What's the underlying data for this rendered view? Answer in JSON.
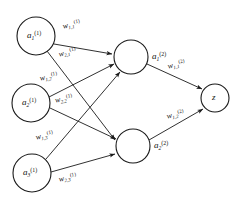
{
  "figure": {
    "type": "neural-network-diagram",
    "background_color": "#ffffff",
    "stroke_color": "#1a1a1a",
    "width": 240,
    "height": 206
  },
  "layers": [
    {
      "name": "input-layer",
      "nodes": [
        {
          "id": "a1-1",
          "base": "a",
          "sub": "1",
          "sup": "(1)",
          "cx": 36,
          "cy": 36,
          "r": 19,
          "label_side": "inside"
        },
        {
          "id": "a2-1",
          "base": "a",
          "sub": "2",
          "sup": "(1)",
          "cx": 31,
          "cy": 103,
          "r": 19,
          "label_side": "inside"
        },
        {
          "id": "a3-1",
          "base": "a",
          "sub": "3",
          "sup": "(1)",
          "cx": 32,
          "cy": 173,
          "r": 19,
          "label_side": "inside"
        }
      ]
    },
    {
      "name": "hidden-layer",
      "nodes": [
        {
          "id": "a1-2",
          "base": "a",
          "sub": "1",
          "sup": "(2)",
          "cx": 131,
          "cy": 57,
          "r": 17,
          "label_side": "right"
        },
        {
          "id": "a2-2",
          "base": "a",
          "sub": "2",
          "sup": "(2)",
          "cx": 133,
          "cy": 146,
          "r": 17,
          "label_side": "right"
        }
      ]
    },
    {
      "name": "output-layer",
      "nodes": [
        {
          "id": "z",
          "base": "z",
          "sub": "",
          "sup": "",
          "cx": 215,
          "cy": 98,
          "r": 14,
          "label_side": "inside"
        }
      ]
    }
  ],
  "edges": [
    {
      "id": "e-a1-h1",
      "from": "a1-1",
      "to": "a1-2"
    },
    {
      "id": "e-a1-h2",
      "from": "a1-1",
      "to": "a2-2"
    },
    {
      "id": "e-a2-h1",
      "from": "a2-1",
      "to": "a1-2"
    },
    {
      "id": "e-a2-h2",
      "from": "a2-1",
      "to": "a2-2"
    },
    {
      "id": "e-a3-h1",
      "from": "a3-1",
      "to": "a1-2"
    },
    {
      "id": "e-a3-h2",
      "from": "a3-1",
      "to": "a2-2"
    },
    {
      "id": "e-h1-z",
      "from": "a1-2",
      "to": "z"
    },
    {
      "id": "e-h2-z",
      "from": "a2-2",
      "to": "z"
    }
  ],
  "node_labels": {
    "a1_1": {
      "base": "a",
      "sub": "1",
      "sup": "(1)"
    },
    "a2_1": {
      "base": "a",
      "sub": "2",
      "sup": "(1)"
    },
    "a3_1": {
      "base": "a",
      "sub": "3",
      "sup": "(1)"
    },
    "a1_2": {
      "base": "a",
      "sub": "1",
      "sup": "(2)"
    },
    "a2_2": {
      "base": "a",
      "sub": "2",
      "sup": "(2)"
    },
    "z": {
      "base": "z",
      "sub": "",
      "sup": ""
    }
  },
  "weight_labels": {
    "w11_1": {
      "base": "w",
      "sub": "1,1",
      "sup": "(1)",
      "edge": "e-a1-h1"
    },
    "w21_1": {
      "base": "w",
      "sub": "2,1",
      "sup": "(1)",
      "edge": "e-a1-h2"
    },
    "w12_1": {
      "base": "w",
      "sub": "1,2",
      "sup": "(1)",
      "edge": "e-a2-h1"
    },
    "w22_1": {
      "base": "w",
      "sub": "2,2",
      "sup": "(1)",
      "edge": "e-a2-h2"
    },
    "w13_1": {
      "base": "w",
      "sub": "1,3",
      "sup": "(1)",
      "edge": "e-a3-h1"
    },
    "w23_1": {
      "base": "w",
      "sub": "2,3",
      "sup": "(1)",
      "edge": "e-a3-h2"
    },
    "w11_2": {
      "base": "w",
      "sub": "1,1",
      "sup": "(2)",
      "edge": "e-h1-z"
    },
    "w12_2": {
      "base": "w",
      "sub": "1,2",
      "sup": "(2)",
      "edge": "e-h2-z"
    }
  }
}
